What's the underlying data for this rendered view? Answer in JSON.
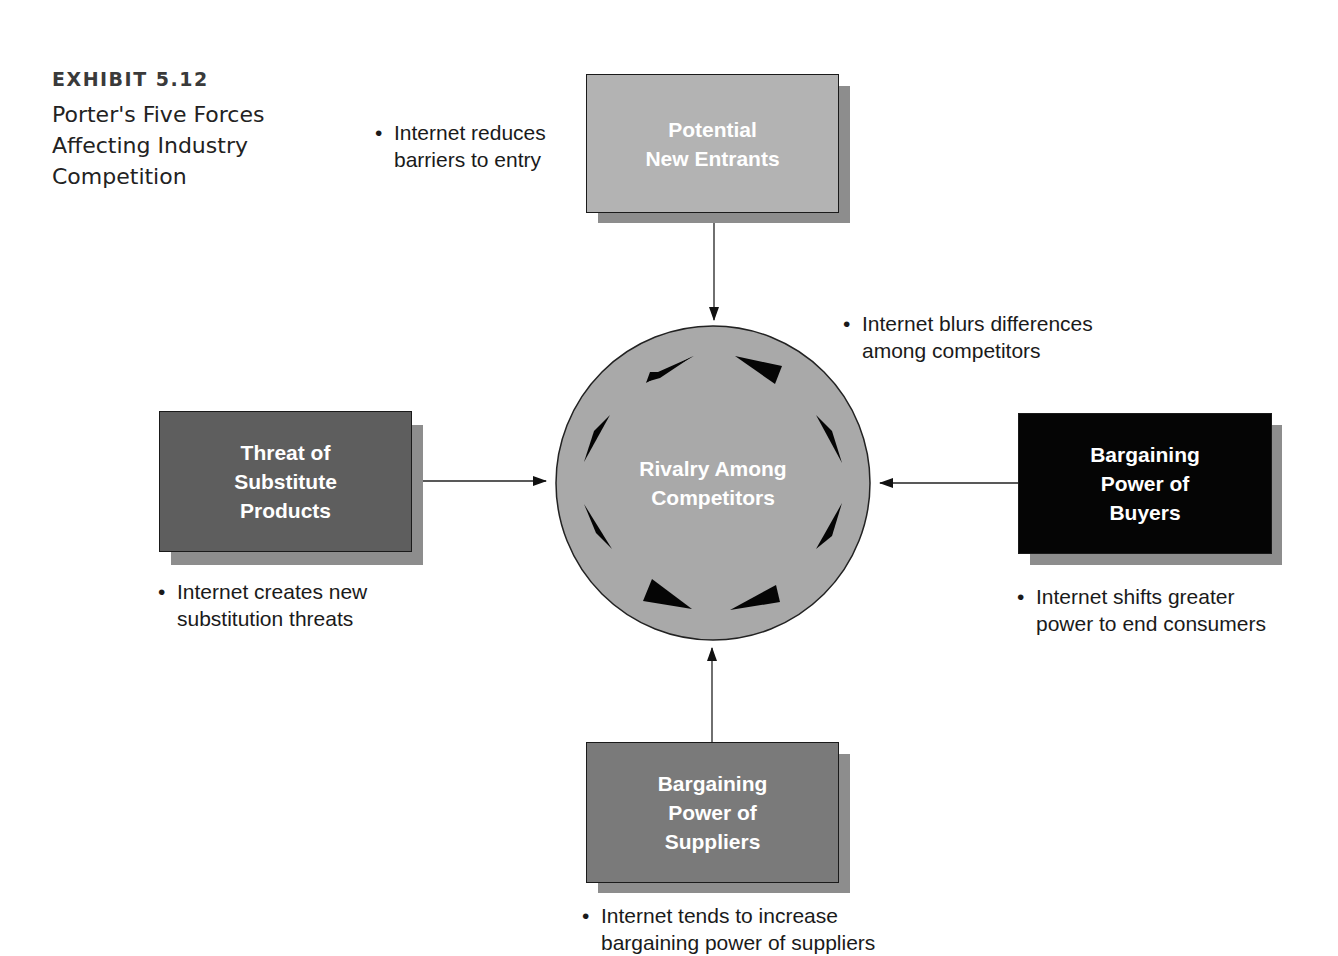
{
  "exhibit": {
    "label": "EXHIBIT 5.12",
    "title": "Porter's Five Forces Affecting Industry Competition"
  },
  "center": {
    "label": "Rivalry Among\nCompetitors",
    "fill": "#a9a9a9",
    "note": {
      "bullet": "•",
      "lines": [
        "Internet blurs differences",
        "among competitors"
      ]
    }
  },
  "forces": {
    "top": {
      "label": "Potential\nNew Entrants",
      "fill": "#b3b3b3",
      "note": {
        "bullet": "•",
        "lines": [
          "Internet reduces",
          "barriers to entry"
        ]
      }
    },
    "left": {
      "label": "Threat of\nSubstitute\nProducts",
      "fill": "#5e5e5e",
      "note": {
        "bullet": "•",
        "lines": [
          "Internet creates new",
          "substitution threats"
        ]
      }
    },
    "right": {
      "label": "Bargaining\nPower of\nBuyers",
      "fill": "#050505",
      "note": {
        "bullet": "•",
        "lines": [
          "Internet shifts greater",
          "power to end consumers"
        ]
      }
    },
    "bottom": {
      "label": "Bargaining\nPower of\nSuppliers",
      "fill": "#7a7a7a",
      "note": {
        "bullet": "•",
        "lines": [
          "Internet tends to increase",
          "bargaining power of suppliers"
        ]
      }
    }
  },
  "colors": {
    "shadow": "#8d8d8d",
    "stroke": "#1a1a1a",
    "text_on_box": "#ffffff"
  }
}
